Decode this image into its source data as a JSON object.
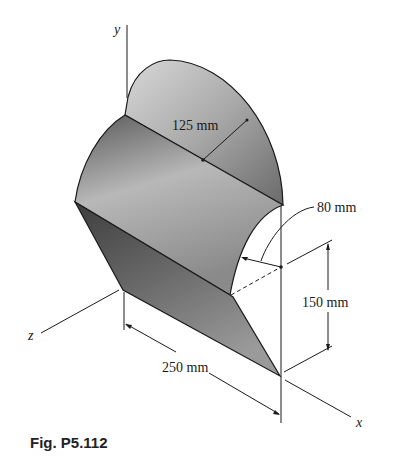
{
  "figure": {
    "caption": "Fig. P5.112",
    "axes": {
      "x": "x",
      "y": "y",
      "z": "z"
    },
    "dimensions": {
      "radius_large": "125 mm",
      "radius_small": "80 mm",
      "height": "150 mm",
      "length": "250 mm"
    },
    "colors": {
      "line": "#1a1a1a",
      "surface_light": "#d4d4d4",
      "surface_mid": "#9a9a9a",
      "surface_dark": "#4a4a4a"
    }
  }
}
